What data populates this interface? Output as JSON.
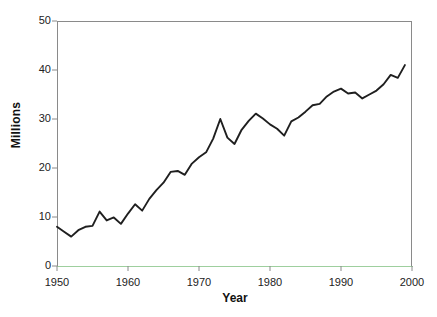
{
  "chart_data": {
    "type": "line",
    "title": "",
    "subtitle": "",
    "xlabel": "Year",
    "ylabel": "Millions",
    "xlim": [
      1950,
      2000
    ],
    "ylim": [
      0,
      50
    ],
    "xticks": [
      1950,
      1960,
      1970,
      1980,
      1990,
      2000
    ],
    "xtick_labels": [
      "1950",
      "1960",
      "1970",
      "1980",
      "1990",
      "2000"
    ],
    "yticks": [
      0,
      10,
      20,
      30,
      40,
      50
    ],
    "ytick_labels": [
      "0",
      "10",
      "20",
      "30",
      "40",
      "50"
    ],
    "grid": false,
    "legend": false,
    "legend_position": "none",
    "line_color": "#1f1f1f",
    "line_width": 1.9,
    "axis_color": "#8a8a8a",
    "baseline_color": "#9ecf9e",
    "background_color": "#ffffff",
    "series": [
      {
        "name": "Millions",
        "x": [
          1950,
          1951,
          1952,
          1953,
          1954,
          1955,
          1956,
          1957,
          1958,
          1959,
          1960,
          1961,
          1962,
          1963,
          1964,
          1965,
          1966,
          1967,
          1968,
          1969,
          1970,
          1971,
          1972,
          1973,
          1974,
          1975,
          1976,
          1977,
          1978,
          1979,
          1980,
          1981,
          1982,
          1983,
          1984,
          1985,
          1986,
          1987,
          1988,
          1989,
          1990,
          1991,
          1992,
          1993,
          1994,
          1995,
          1996,
          1997,
          1998,
          1999
        ],
        "values": [
          8.0,
          7.0,
          6.0,
          7.3,
          8.0,
          8.2,
          11.1,
          9.3,
          9.9,
          8.6,
          10.7,
          12.6,
          11.3,
          13.7,
          15.5,
          17.0,
          19.2,
          19.4,
          18.6,
          20.9,
          22.2,
          23.2,
          26.0,
          30.0,
          26.2,
          24.9,
          27.8,
          29.6,
          31.1,
          30.1,
          28.9,
          28.0,
          26.6,
          29.5,
          30.3,
          31.5,
          32.8,
          33.1,
          34.6,
          35.6,
          36.2,
          35.2,
          35.4,
          34.2,
          35.0,
          35.8,
          37.1,
          39.0,
          38.4,
          41.0
        ]
      }
    ]
  },
  "axis_titles": {
    "y": "Millions",
    "x": "Year"
  }
}
